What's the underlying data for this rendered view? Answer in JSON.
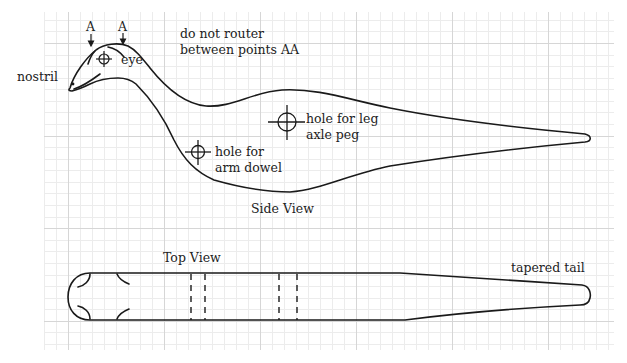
{
  "figure": {
    "side_view": {
      "title": "Side View",
      "labels": {
        "nostril": "nostril",
        "eye": "eye",
        "point_a1": "A",
        "point_a2": "A",
        "note_line1": "do not router",
        "note_line2": "between points AA",
        "leg_hole_line1": "hole for leg",
        "leg_hole_line2": "axle peg",
        "arm_hole_line1": "hole for",
        "arm_hole_line2": "arm dowel"
      }
    },
    "top_view": {
      "title": "Top View",
      "labels": {
        "tail": "tapered tail"
      }
    },
    "colors": {
      "line": "#1a1a1a",
      "grid_minor": "#ececec",
      "grid_major": "#d6d6d6",
      "background": "#ffffff"
    }
  }
}
